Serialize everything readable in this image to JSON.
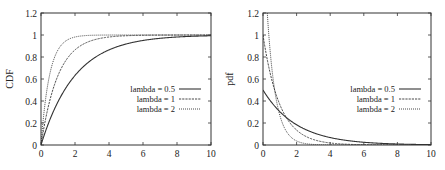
{
  "chart_data": [
    {
      "type": "line",
      "title": "",
      "xlabel": "",
      "ylabel": "CDF",
      "xlim": [
        0,
        10
      ],
      "ylim": [
        0,
        1.2
      ],
      "xticks": [
        0,
        2,
        4,
        6,
        8,
        10
      ],
      "yticks": [
        0,
        0.2,
        0.4,
        0.6,
        0.8,
        1,
        1.2
      ],
      "grid": false,
      "legend_position": "center-right",
      "function": "1 - exp(-lambda*x)",
      "series": [
        {
          "name": "lambda = 0.5",
          "style": "solid",
          "lambda": 0.5,
          "x": [
            0,
            1,
            2,
            3,
            4,
            6,
            8,
            10
          ],
          "y": [
            0,
            0.39,
            0.63,
            0.78,
            0.86,
            0.95,
            0.98,
            0.99
          ]
        },
        {
          "name": "lambda = 1",
          "style": "dashed",
          "lambda": 1,
          "x": [
            0,
            1,
            2,
            3,
            4,
            6,
            8,
            10
          ],
          "y": [
            0,
            0.63,
            0.86,
            0.95,
            0.98,
            1.0,
            1.0,
            1.0
          ]
        },
        {
          "name": "lambda = 2",
          "style": "dotted",
          "lambda": 2,
          "x": [
            0,
            1,
            2,
            3,
            4,
            6,
            8,
            10
          ],
          "y": [
            0,
            0.86,
            0.98,
            1.0,
            1.0,
            1.0,
            1.0,
            1.0
          ]
        }
      ]
    },
    {
      "type": "line",
      "title": "",
      "xlabel": "",
      "ylabel": "pdf",
      "xlim": [
        0,
        10
      ],
      "ylim": [
        0,
        1.2
      ],
      "xticks": [
        0,
        2,
        4,
        6,
        8,
        10
      ],
      "yticks": [
        0,
        0.2,
        0.4,
        0.6,
        0.8,
        1,
        1.2
      ],
      "grid": false,
      "legend_position": "center-right",
      "function": "lambda * exp(-lambda*x)",
      "series": [
        {
          "name": "lambda = 0.5",
          "style": "solid",
          "lambda": 0.5,
          "x": [
            0,
            1,
            2,
            3,
            4,
            6,
            8,
            10
          ],
          "y": [
            0.5,
            0.3,
            0.18,
            0.11,
            0.07,
            0.02,
            0.01,
            0.0
          ]
        },
        {
          "name": "lambda = 1",
          "style": "dashed",
          "lambda": 1,
          "x": [
            0,
            1,
            2,
            3,
            4,
            6,
            8,
            10
          ],
          "y": [
            1.0,
            0.37,
            0.14,
            0.05,
            0.02,
            0.0,
            0.0,
            0.0
          ]
        },
        {
          "name": "lambda = 2",
          "style": "dotted",
          "lambda": 2,
          "x": [
            0,
            1,
            2,
            3,
            4,
            6,
            8,
            10
          ],
          "y": [
            2.0,
            0.27,
            0.04,
            0.0,
            0.0,
            0.0,
            0.0,
            0.0
          ]
        }
      ]
    }
  ],
  "panels": [
    {
      "ylabel": "CDF"
    },
    {
      "ylabel": "pdf"
    }
  ]
}
